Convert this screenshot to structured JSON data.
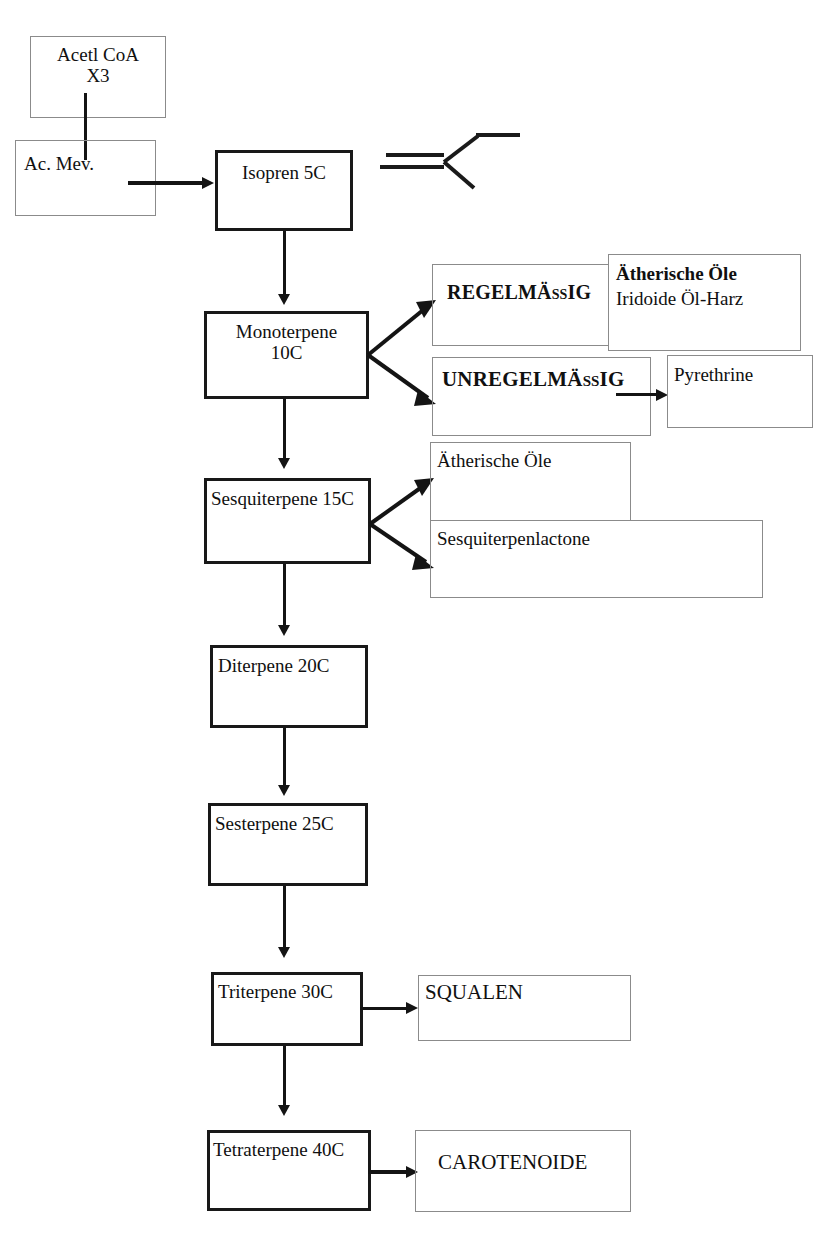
{
  "diagram": {
    "nodes": {
      "acetyl_coa": "Acetl CoA\nX3",
      "ac_mev": "Ac. Mev.",
      "isopren": "Isopren 5C",
      "monoterpene": "Monoterpene\n10C",
      "regelmaessig": "REGELMÄßIG",
      "unregelmaessig": "UNREGELMÄßIG",
      "aetherische_oele_iridoide_line1": "Ätherische Öle",
      "aetherische_oele_iridoide_line2": "Iridoide Öl-Harz",
      "pyrethrine": "Pyrethrine",
      "sesquiterpene": "Sesquiterpene 15C",
      "aetherische_oele": "Ätherische Öle",
      "sesquiterpenlactone": "Sesquiterpenlactone",
      "diterpene": "Diterpene 20C",
      "sesterpene": "Sesterpene 25C",
      "triterpene": "Triterpene 30C",
      "squalen": "SQUALEN",
      "tetraterpene": "Tetraterpene 40C",
      "carotenoide": "CAROTENOIDE"
    },
    "structure_formula": "isoprene-skeletal-structure",
    "colors": {
      "ink": "#141414",
      "thin_border": "#8b8b8b",
      "bold_border": "#181818",
      "background": "#ffffff"
    }
  }
}
